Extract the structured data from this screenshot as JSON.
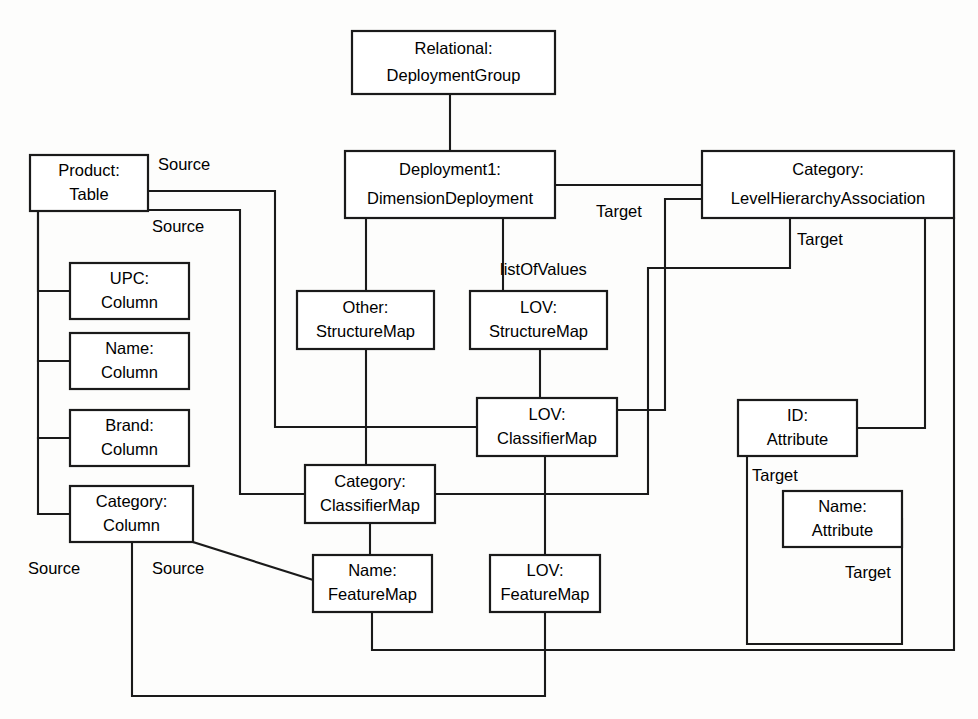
{
  "diagram": {
    "type": "object-instance-diagram",
    "canvas": {
      "width": 978,
      "height": 719
    },
    "style": {
      "background_color": "#fdfdfc",
      "node_fill": "#ffffff",
      "stroke_color": "#1a1a1a",
      "text_color": "#000000"
    }
  },
  "nodes": [
    {
      "id": "relational-deploymentgroup",
      "name": "Relational",
      "type": "DeploymentGroup",
      "line1": "Relational:",
      "line2": "DeploymentGroup",
      "x": 352,
      "y": 31,
      "w": 203,
      "h": 63
    },
    {
      "id": "product-table",
      "name": "Product",
      "type": "Table",
      "line1": "Product:",
      "line2": "Table",
      "x": 30,
      "y": 155,
      "w": 118,
      "h": 56
    },
    {
      "id": "deployment1-dimensiondeployment",
      "name": "Deployment1",
      "type": "DimensionDeployment",
      "line1": "Deployment1:",
      "line2": "DimensionDeployment",
      "x": 345,
      "y": 151,
      "w": 210,
      "h": 67
    },
    {
      "id": "category-levelhierarchyassociation",
      "name": "Category",
      "type": "LevelHierarchyAssociation",
      "line1": "Category:",
      "line2": "LevelHierarchyAssociation",
      "x": 702,
      "y": 151,
      "w": 252,
      "h": 67
    },
    {
      "id": "upc-column",
      "name": "UPC",
      "type": "Column",
      "line1": "UPC:",
      "line2": "Column",
      "x": 70,
      "y": 263,
      "w": 119,
      "h": 56
    },
    {
      "id": "name-column",
      "name": "Name",
      "type": "Column",
      "line1": "Name:",
      "line2": "Column",
      "x": 70,
      "y": 333,
      "w": 119,
      "h": 56
    },
    {
      "id": "brand-column",
      "name": "Brand",
      "type": "Column",
      "line1": "Brand:",
      "line2": "Column",
      "x": 70,
      "y": 410,
      "w": 119,
      "h": 56
    },
    {
      "id": "category-column",
      "name": "Category",
      "type": "Column",
      "line1": "Category:",
      "line2": "Column",
      "x": 70,
      "y": 486,
      "w": 123,
      "h": 56
    },
    {
      "id": "other-structuremap",
      "name": "Other",
      "type": "StructureMap",
      "line1": "Other:",
      "line2": "StructureMap",
      "x": 297,
      "y": 291,
      "w": 137,
      "h": 58
    },
    {
      "id": "lov-structuremap",
      "name": "LOV",
      "type": "StructureMap",
      "line1": "LOV:",
      "line2": "StructureMap",
      "x": 470,
      "y": 291,
      "w": 137,
      "h": 58
    },
    {
      "id": "lov-classifiermap",
      "name": "LOV",
      "type": "ClassifierMap",
      "line1": "LOV:",
      "line2": "ClassifierMap",
      "x": 477,
      "y": 398,
      "w": 140,
      "h": 58
    },
    {
      "id": "id-attribute",
      "name": "ID",
      "type": "Attribute",
      "line1": "ID:",
      "line2": "Attribute",
      "x": 738,
      "y": 400,
      "w": 119,
      "h": 56
    },
    {
      "id": "category-classifiermap",
      "name": "Category",
      "type": "ClassifierMap",
      "line1": "Category:",
      "line2": "ClassifierMap",
      "x": 305,
      "y": 465,
      "w": 130,
      "h": 58
    },
    {
      "id": "name-attribute",
      "name": "Name",
      "type": "Attribute",
      "line1": "Name:",
      "line2": "Attribute",
      "x": 783,
      "y": 491,
      "w": 119,
      "h": 56
    },
    {
      "id": "name-featuremap",
      "name": "Name",
      "type": "FeatureMap",
      "line1": "Name:",
      "line2": "FeatureMap",
      "x": 313,
      "y": 555,
      "w": 119,
      "h": 57
    },
    {
      "id": "lov-featuremap",
      "name": "LOV",
      "type": "FeatureMap",
      "line1": "LOV:",
      "line2": "FeatureMap",
      "x": 490,
      "y": 555,
      "w": 110,
      "h": 57
    }
  ],
  "edges": [
    {
      "id": "e-group-deployment",
      "from": "relational-deploymentgroup",
      "to": "deployment1-dimensiondeployment",
      "points": "450,94 450,151"
    },
    {
      "id": "e-deployment-category",
      "from": "deployment1-dimensiondeployment",
      "to": "category-levelhierarchyassociation",
      "points": "555,185 702,185"
    },
    {
      "id": "e-deployment-other",
      "from": "deployment1-dimensiondeployment",
      "to": "other-structuremap",
      "points": "366,218 366,291"
    },
    {
      "id": "e-deployment-lovstruct",
      "from": "deployment1-dimensiondeployment",
      "to": "lov-structuremap",
      "points": "503,218 503,291"
    },
    {
      "id": "e-product-right-upper",
      "from": "product-table",
      "to": "lov-classifiermap",
      "points": "148,191 275,191 275,427 477,427"
    },
    {
      "id": "e-product-right-lower",
      "from": "product-table",
      "to": "category-classifiermap",
      "points": "148,210 240,210 240,494 305,494"
    },
    {
      "id": "e-product-upc",
      "from": "product-table",
      "to": "upc-column",
      "points": "38,211 38,291 70,291"
    },
    {
      "id": "e-product-name",
      "from": "product-table",
      "to": "name-column",
      "points": "38,361 70,361"
    },
    {
      "id": "e-product-brand",
      "from": "product-table",
      "to": "brand-column",
      "points": "38,438 70,438"
    },
    {
      "id": "e-product-category",
      "from": "product-table",
      "to": "category-column",
      "points": "38,514 70,514"
    },
    {
      "id": "e-product-spine",
      "from": "product-table",
      "to": "category-column",
      "points": "38,211 38,514"
    },
    {
      "id": "e-other-categoryclassifier",
      "from": "other-structuremap",
      "to": "category-classifiermap",
      "points": "366,349 366,465"
    },
    {
      "id": "e-lovstruct-lovclassifier",
      "from": "lov-structuremap",
      "to": "lov-classifiermap",
      "points": "540,349 540,398"
    },
    {
      "id": "e-categorytarget-lovclassifier",
      "from": "category-levelhierarchyassociation",
      "to": "lov-classifiermap",
      "points": "702,199 665,199 665,410 617,410"
    },
    {
      "id": "e-categorytarget-lovfeature",
      "from": "category-levelhierarchyassociation",
      "to": "lov-featuremap",
      "points": "790,218 790,268 648,268 648,494 435,494"
    },
    {
      "id": "e-category-id",
      "from": "category-levelhierarchyassociation",
      "to": "id-attribute",
      "points": "925,218 925,428 857,428"
    },
    {
      "id": "e-id-name-attribute",
      "from": "id-attribute",
      "to": "name-attribute",
      "points": "747,456 747,644 902,644 902,519"
    },
    {
      "id": "e-lovclassifier-lovfeature",
      "from": "lov-classifiermap",
      "to": "lov-featuremap",
      "points": "545,456 545,555"
    },
    {
      "id": "e-categoryclassifier-namefeature",
      "from": "category-classifiermap",
      "to": "name-featuremap",
      "points": "370,523 370,555"
    },
    {
      "id": "e-categorycolumn-namefeature",
      "from": "category-column",
      "to": "name-featuremap",
      "points": "193,542 313,580"
    },
    {
      "id": "e-categorycolumn-bottom",
      "from": "category-column",
      "to": "lov-featuremap",
      "points": "132,542 132,696 545,696 545,612"
    },
    {
      "id": "e-namefeature-bottom",
      "from": "name-featuremap",
      "to": "category-levelhierarchyassociation",
      "points": "372,612 372,650 954,650 954,218"
    }
  ],
  "edge_labels": [
    {
      "id": "label-source-1",
      "text": "Source",
      "x": 158,
      "y": 166
    },
    {
      "id": "label-source-2",
      "text": "Source",
      "x": 152,
      "y": 228
    },
    {
      "id": "label-source-3",
      "text": "Source",
      "x": 28,
      "y": 570
    },
    {
      "id": "label-source-4",
      "text": "Source",
      "x": 152,
      "y": 570
    },
    {
      "id": "label-target-1",
      "text": "Target",
      "x": 596,
      "y": 213
    },
    {
      "id": "label-target-2",
      "text": "Target",
      "x": 797,
      "y": 241
    },
    {
      "id": "label-target-3",
      "text": "Target",
      "x": 752,
      "y": 477
    },
    {
      "id": "label-target-4",
      "text": "Target",
      "x": 845,
      "y": 574
    },
    {
      "id": "label-listofvalues",
      "text": "listOfValues",
      "x": 500,
      "y": 271
    }
  ]
}
